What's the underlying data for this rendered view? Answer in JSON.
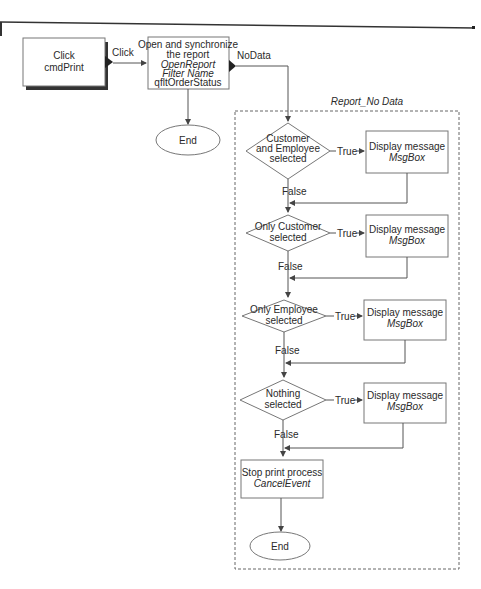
{
  "diagram": {
    "start": {
      "line1": "Click",
      "line2": "cmdPrint"
    },
    "click_label": "Click",
    "open_box": {
      "line1": "Open and synchronize",
      "line2": "the report",
      "line3": "OpenReport",
      "line4": "Filter Name",
      "line5": "qfltOrderStatus"
    },
    "end_top": "End",
    "nodata_label": "NoData",
    "group_title": "Report_No Data",
    "decisions": [
      {
        "lines": [
          "Customer",
          "and Employee",
          "selected"
        ],
        "true_label": "True",
        "false_label": "False",
        "action_line1": "Display message",
        "action_line2": "MsgBox"
      },
      {
        "lines": [
          "Only Customer",
          "selected"
        ],
        "true_label": "True",
        "false_label": "False",
        "action_line1": "Display message",
        "action_line2": "MsgBox"
      },
      {
        "lines": [
          "Only Employee",
          "selected"
        ],
        "true_label": "True",
        "false_label": "False",
        "action_line1": "Display message",
        "action_line2": "MsgBox"
      },
      {
        "lines": [
          "Nothing",
          "selected"
        ],
        "true_label": "True",
        "false_label": "False",
        "action_line1": "Display message",
        "action_line2": "MsgBox"
      }
    ],
    "stop_box": {
      "line1": "Stop print process",
      "line2": "CancelEvent"
    },
    "end_bottom": "End"
  }
}
